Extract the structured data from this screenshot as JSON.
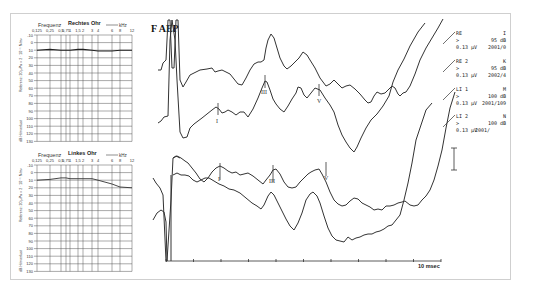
{
  "title": "F AEP",
  "audiograms": [
    {
      "title": "Rechtes Ohr",
      "freq_label": "Frequenz",
      "unit_label": "kHz",
      "freq_ticks": [
        "0,125",
        "0,25",
        "0,5",
        "0,75",
        "1",
        "1,5",
        "2",
        "3",
        "4",
        "6",
        "8",
        "12"
      ],
      "y_label_top": "Referenz: 20 µPa = 2 · 10⁻⁵ N/m²",
      "y_label_bottom": "dB Hörverlust",
      "y_ticks": [
        "-10",
        "0",
        "10",
        "20",
        "30",
        "40",
        "50",
        "60",
        "70",
        "80",
        "90",
        "100",
        "110",
        "120",
        "130"
      ]
    },
    {
      "title": "Linkes Ohr",
      "freq_label": "Frequenz",
      "unit_label": "kHz",
      "freq_ticks": [
        "0,125",
        "0,25",
        "0,5",
        "0,75",
        "1",
        "1,5",
        "2",
        "3",
        "4",
        "6",
        "8",
        "12"
      ],
      "y_label_top": "Referenz: 20 µPa = 2 · 10⁻⁵ N/m²",
      "y_label_bottom": "dB Hörverlust",
      "y_ticks": [
        "-10",
        "0",
        "10",
        "20",
        "30",
        "40",
        "50",
        "60",
        "70",
        "80",
        "90",
        "100",
        "110",
        "120",
        "130"
      ]
    }
  ],
  "legend": [
    {
      "label": "RE",
      "code": "I",
      "stim": ">",
      "level": "95 dB",
      "scale": "0.13 µV",
      "id": "2001/0"
    },
    {
      "label": "RE 2",
      "code": "K",
      "stim": ">",
      "level": "95 dB",
      "scale": "0.13 µV",
      "id": "2002/4"
    },
    {
      "label": "LI 1",
      "code": "M",
      "stim": ">",
      "level": "100 dB",
      "scale": "0.13 µV",
      "id": "2001/109"
    },
    {
      "label": "LI 2",
      "code": "N",
      "stim": ">",
      "level": "100 dB",
      "scale": "0.13 µV",
      "id": "2001/"
    }
  ],
  "x_axis_label": "10 msec",
  "wave_markers": {
    "I": "I",
    "III": "III",
    "V": "V"
  },
  "chart_data": [
    {
      "type": "line",
      "title": "Rechtes Ohr",
      "xlabel": "Frequenz (kHz)",
      "ylabel": "dB Hörverlust",
      "categories": [
        "0,125",
        "0,25",
        "0,5",
        "0,75",
        "1",
        "1,5",
        "2",
        "3",
        "4",
        "6",
        "8",
        "12"
      ],
      "series": [
        {
          "name": "Rechtes Ohr",
          "values": [
            10,
            9,
            10,
            10,
            10,
            9,
            9,
            10,
            11,
            11,
            10,
            10
          ]
        }
      ],
      "ylim": [
        -10,
        130
      ],
      "y_inverted": true,
      "grid": true
    },
    {
      "type": "line",
      "title": "Linkes Ohr",
      "xlabel": "Frequenz (kHz)",
      "ylabel": "dB Hörverlust",
      "categories": [
        "0,125",
        "0,25",
        "0,5",
        "0,75",
        "1",
        "1,5",
        "2",
        "3",
        "4",
        "6",
        "8",
        "12"
      ],
      "series": [
        {
          "name": "Linkes Ohr",
          "values": [
            10,
            9,
            7,
            7,
            8,
            8,
            8,
            8,
            10,
            15,
            19,
            20
          ]
        }
      ],
      "ylim": [
        -10,
        130
      ],
      "y_inverted": true,
      "grid": true
    },
    {
      "type": "line",
      "title": "F AEP",
      "xlabel": "msec",
      "x_range_ms": [
        0,
        10
      ],
      "x_ticks_ms": [
        0,
        1,
        2,
        3,
        4,
        5,
        6,
        7,
        8,
        9,
        10
      ],
      "series": [
        {
          "name": "RE",
          "level": "95 dB",
          "peaks_marked": []
        },
        {
          "name": "RE 2",
          "level": "95 dB",
          "peaks_marked": [
            "I",
            "III",
            "V"
          ]
        },
        {
          "name": "LI 1",
          "level": "100 dB",
          "peaks_marked": [
            "I",
            "III",
            "V"
          ]
        },
        {
          "name": "LI 2",
          "level": "100 dB",
          "peaks_marked": []
        }
      ],
      "scale_bar": "0.13 µV"
    }
  ]
}
